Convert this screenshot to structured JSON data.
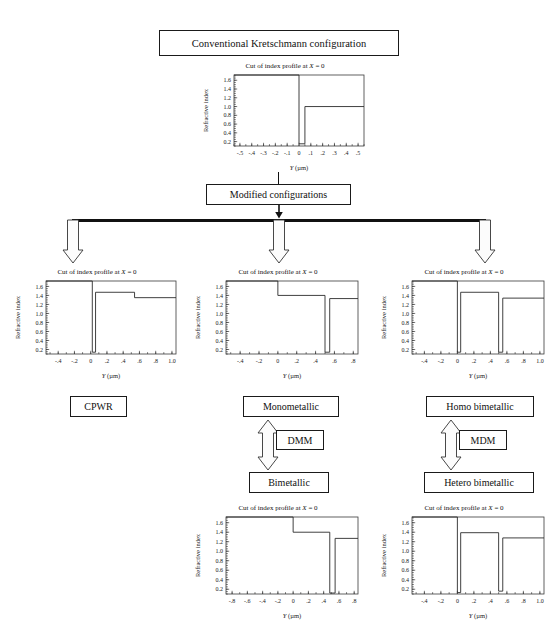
{
  "nodes": {
    "conventional": "Conventional Kretschmann configuration",
    "modified": "Modified configurations",
    "cpwr": "CPWR",
    "monometallic": "Monometallic",
    "homo_bimetallic": "Homo bimetallic",
    "bimetallic": "Bimetallic",
    "hetero_bimetallic": "Hetero bimetallic",
    "dmm": "DMM",
    "mdm": "MDM"
  },
  "chart_common": {
    "title_prefix": "Cut of index profile at ",
    "title_math": "X",
    "title_suffix": " = 0",
    "ylabel": "Refractive index",
    "xlabel_italic": "Y",
    "xlabel_unit": " (µm)",
    "yticks": [
      "1.6",
      "1.4",
      "1.2",
      "1.0",
      "0.8",
      "0.6",
      "0.4",
      "0.2"
    ],
    "ytickvals": [
      1.6,
      1.4,
      1.2,
      1.0,
      0.8,
      0.6,
      0.4,
      0.2
    ],
    "ylim": [
      0.1,
      1.72
    ]
  },
  "chart_data": [
    {
      "id": "conventional",
      "type": "line",
      "title": "Cut of index profile at X = 0",
      "xlabel": "Y (µm)",
      "ylabel": "Refractive index",
      "xlim": [
        -0.55,
        0.55
      ],
      "ylim": [
        0.1,
        1.72
      ],
      "xticks": [
        -0.5,
        -0.4,
        -0.3,
        -0.2,
        -0.1,
        0,
        0.1,
        0.2,
        0.3,
        0.4,
        0.5
      ],
      "xticklabels": [
        "-.5",
        "-.4",
        "-.3",
        "-.2",
        "-.1",
        "0",
        ".1",
        ".2",
        ".3",
        ".4",
        ".5"
      ],
      "yticks": [
        1.6,
        1.4,
        1.2,
        1.0,
        0.8,
        0.6,
        0.4,
        0.2
      ],
      "yticklabels": [
        "1.6",
        "1.4",
        "1.2",
        "1.0",
        "0.8",
        "0.6",
        "0.4",
        "0.2"
      ],
      "grid": false,
      "legend": null,
      "points": [
        [
          -0.55,
          1.72
        ],
        [
          0.0,
          1.72
        ],
        [
          0.0,
          0.15
        ],
        [
          0.05,
          0.15
        ],
        [
          0.05,
          1.0
        ],
        [
          0.55,
          1.0
        ]
      ]
    },
    {
      "id": "cpwr",
      "type": "line",
      "title": "Cut of index profile at X = 0",
      "xlabel": "Y (µm)",
      "ylabel": "Refractive index",
      "xlim": [
        -0.55,
        1.05
      ],
      "ylim": [
        0.1,
        1.72
      ],
      "xticks": [
        -0.4,
        -0.2,
        0,
        0.2,
        0.4,
        0.6,
        0.8,
        1.0
      ],
      "xticklabels": [
        "-.4",
        "-.2",
        "0",
        ".2",
        ".4",
        ".6",
        ".8",
        "1.0"
      ],
      "yticks": [
        1.6,
        1.4,
        1.2,
        1.0,
        0.8,
        0.6,
        0.4,
        0.2
      ],
      "yticklabels": [
        "1.6",
        "1.4",
        "1.2",
        "1.0",
        "0.8",
        "0.6",
        "0.4",
        "0.2"
      ],
      "grid": false,
      "legend": null,
      "points": [
        [
          -0.55,
          1.72
        ],
        [
          0.02,
          1.72
        ],
        [
          0.02,
          0.14
        ],
        [
          0.06,
          0.14
        ],
        [
          0.06,
          1.47
        ],
        [
          0.54,
          1.47
        ],
        [
          0.54,
          1.35
        ],
        [
          1.05,
          1.35
        ]
      ]
    },
    {
      "id": "monometallic",
      "type": "line",
      "title": "Cut of index profile at X = 0",
      "xlabel": "Y (µm)",
      "ylabel": "Refractive index",
      "xlim": [
        -0.55,
        0.85
      ],
      "ylim": [
        0.1,
        1.72
      ],
      "xticks": [
        -0.4,
        -0.2,
        0,
        0.2,
        0.4,
        0.6,
        0.8
      ],
      "xticklabels": [
        "-.4",
        "-.2",
        "0",
        ".2",
        ".4",
        ".6",
        ".8"
      ],
      "yticks": [
        1.6,
        1.4,
        1.2,
        1.0,
        0.8,
        0.6,
        0.4,
        0.2
      ],
      "yticklabels": [
        "1.6",
        "1.4",
        "1.2",
        "1.0",
        "0.8",
        "0.6",
        "0.4",
        "0.2"
      ],
      "grid": false,
      "legend": null,
      "points": [
        [
          -0.55,
          1.72
        ],
        [
          0.0,
          1.72
        ],
        [
          0.0,
          1.4
        ],
        [
          0.5,
          1.4
        ],
        [
          0.5,
          0.14
        ],
        [
          0.55,
          0.14
        ],
        [
          0.55,
          1.33
        ],
        [
          0.85,
          1.33
        ]
      ]
    },
    {
      "id": "homo_bimetallic",
      "type": "line",
      "title": "Cut of index profile at X = 0",
      "xlabel": "Y (µm)",
      "ylabel": "Refractive index",
      "xlim": [
        -0.55,
        1.05
      ],
      "ylim": [
        0.1,
        1.72
      ],
      "xticks": [
        -0.4,
        -0.2,
        0,
        0.2,
        0.4,
        0.6,
        0.8,
        1.0
      ],
      "xticklabels": [
        "-.4",
        "-.2",
        "0",
        ".2",
        ".4",
        ".6",
        ".8",
        "1.0"
      ],
      "yticks": [
        1.6,
        1.4,
        1.2,
        1.0,
        0.8,
        0.6,
        0.4,
        0.2
      ],
      "yticklabels": [
        "1.6",
        "1.4",
        "1.2",
        "1.0",
        "0.8",
        "0.6",
        "0.4",
        "0.2"
      ],
      "grid": false,
      "legend": null,
      "points": [
        [
          -0.55,
          1.72
        ],
        [
          0.0,
          1.72
        ],
        [
          0.0,
          0.14
        ],
        [
          0.04,
          0.14
        ],
        [
          0.04,
          1.47
        ],
        [
          0.5,
          1.47
        ],
        [
          0.5,
          0.14
        ],
        [
          0.55,
          0.14
        ],
        [
          0.55,
          1.34
        ],
        [
          1.05,
          1.34
        ]
      ]
    },
    {
      "id": "bimetallic",
      "type": "line",
      "title": "Cut of index profile at X = 0",
      "xlabel": "Y (µm)",
      "ylabel": "Refractive index",
      "xlim": [
        -0.88,
        0.85
      ],
      "ylim": [
        0.1,
        1.72
      ],
      "xticks": [
        -0.8,
        -0.6,
        -0.4,
        -0.2,
        0,
        0.2,
        0.4,
        0.6,
        0.8
      ],
      "xticklabels": [
        "-.8",
        "-.6",
        "-.4",
        "-.2",
        "0",
        ".2",
        ".4",
        ".6",
        ".8"
      ],
      "yticks": [
        1.6,
        1.4,
        1.2,
        1.0,
        0.8,
        0.6,
        0.4,
        0.2
      ],
      "yticklabels": [
        "1.6",
        "1.4",
        "1.2",
        "1.0",
        "0.8",
        "0.6",
        "0.4",
        "0.2"
      ],
      "grid": false,
      "legend": null,
      "points": [
        [
          -0.88,
          1.72
        ],
        [
          0.0,
          1.72
        ],
        [
          0.0,
          1.4
        ],
        [
          0.48,
          1.4
        ],
        [
          0.48,
          0.12
        ],
        [
          0.55,
          0.12
        ],
        [
          0.55,
          1.27
        ],
        [
          0.85,
          1.27
        ]
      ]
    },
    {
      "id": "hetero_bimetallic",
      "type": "line",
      "title": "Cut of index profile at X = 0",
      "xlabel": "Y (µm)",
      "ylabel": "Refractive index",
      "xlim": [
        -0.55,
        1.05
      ],
      "ylim": [
        0.1,
        1.72
      ],
      "xticks": [
        -0.4,
        -0.2,
        0,
        0.2,
        0.4,
        0.6,
        0.8,
        1.0
      ],
      "xticklabels": [
        "-.4",
        "-.2",
        "0",
        ".2",
        ".4",
        ".6",
        ".8",
        "1.0"
      ],
      "yticks": [
        1.6,
        1.4,
        1.2,
        1.0,
        0.8,
        0.6,
        0.4,
        0.2
      ],
      "yticklabels": [
        "1.6",
        "1.4",
        "1.2",
        "1.0",
        "0.8",
        "0.6",
        "0.4",
        "0.2"
      ],
      "grid": false,
      "legend": null,
      "points": [
        [
          -0.55,
          1.72
        ],
        [
          0.0,
          1.72
        ],
        [
          0.0,
          0.13
        ],
        [
          0.04,
          0.13
        ],
        [
          0.04,
          1.39
        ],
        [
          0.5,
          1.39
        ],
        [
          0.5,
          0.16
        ],
        [
          0.55,
          0.16
        ],
        [
          0.55,
          1.28
        ],
        [
          1.05,
          1.28
        ]
      ]
    }
  ]
}
